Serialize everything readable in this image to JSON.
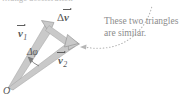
{
  "figure": {
    "clipped_header_text": "…ange acceleration",
    "origin_label": "O",
    "annotation_line1": "These two triangles",
    "annotation_line2": "are similar.",
    "colors": {
      "vector_fill": "#c9c9c9",
      "vector_stroke": "#8f8f8f",
      "label_text": "#595959",
      "annotation_text": "#8c8c8c",
      "dotted_leader": "#b6b6b6",
      "background": "#ffffff"
    },
    "labels": {
      "delta_v": {
        "symbol": "v",
        "prefix": "Δ",
        "subscript": "",
        "vector": true
      },
      "v1": {
        "symbol": "v",
        "prefix": "",
        "subscript": "1",
        "vector": true
      },
      "v2": {
        "symbol": "v",
        "prefix": "",
        "subscript": "2",
        "vector": true
      },
      "delta_phi": {
        "text": "Δφ"
      }
    },
    "geometry": {
      "origin": [
        8,
        88
      ],
      "v1_tip": [
        52,
        22
      ],
      "v2_tip": [
        78,
        44
      ],
      "angle_arc_label_pos": [
        27,
        48
      ]
    },
    "icon_names": [
      "vector-arrowhead-icon",
      "angle-arc-arrow-icon",
      "dotted-leader-arrow-icon"
    ]
  }
}
